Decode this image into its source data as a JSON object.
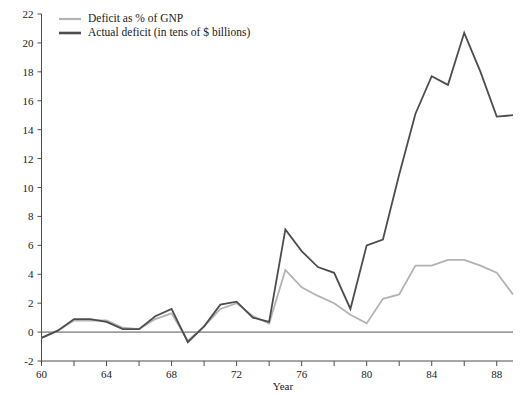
{
  "chart_data": {
    "type": "line",
    "title": "",
    "xlabel": "Year",
    "ylabel": "",
    "xlim": [
      60,
      89
    ],
    "ylim": [
      -2,
      22
    ],
    "grid": false,
    "legend_position": "top-left",
    "x": [
      60,
      61,
      62,
      63,
      64,
      65,
      66,
      67,
      68,
      69,
      70,
      71,
      72,
      73,
      74,
      75,
      76,
      77,
      78,
      79,
      80,
      81,
      82,
      83,
      84,
      85,
      86,
      87,
      88,
      89
    ],
    "x_tick_labels": [
      "60",
      "64",
      "68",
      "72",
      "76",
      "80",
      "84",
      "88"
    ],
    "x_tick_values": [
      60,
      64,
      68,
      72,
      76,
      80,
      84,
      88
    ],
    "x_minor_tick_values": [
      62,
      66,
      70,
      74,
      78,
      82,
      86
    ],
    "y_tick_labels": [
      "-2",
      "0",
      "2",
      "4",
      "6",
      "8",
      "10",
      "12",
      "14",
      "16",
      "18",
      "20",
      "22"
    ],
    "y_tick_values": [
      -2,
      0,
      2,
      4,
      6,
      8,
      10,
      12,
      14,
      16,
      18,
      20,
      22
    ],
    "series": [
      {
        "name": "Deficit as % of GNP",
        "color": "#b3b3b3",
        "line_width": 1.8,
        "values": [
          -0.4,
          0.1,
          0.8,
          0.8,
          0.8,
          0.3,
          0.2,
          0.9,
          1.3,
          -0.6,
          0.4,
          1.6,
          2.0,
          1.1,
          0.6,
          4.3,
          3.1,
          2.5,
          2.0,
          1.2,
          0.6,
          2.3,
          2.6,
          4.6,
          4.6,
          5.0,
          5.0,
          4.6,
          4.1,
          2.6
        ]
      },
      {
        "name": "Actual deficit (in tens of $ billions)",
        "color": "#4d4d4d",
        "line_width": 1.8,
        "values": [
          -0.4,
          0.1,
          0.9,
          0.9,
          0.7,
          0.2,
          0.2,
          1.1,
          1.6,
          -0.7,
          0.4,
          1.9,
          2.1,
          1.0,
          0.7,
          7.1,
          5.6,
          4.5,
          4.1,
          1.6,
          6.0,
          6.4,
          10.9,
          15.1,
          17.7,
          17.1,
          20.7,
          18.0,
          14.9,
          15.0
        ]
      }
    ],
    "legend": [
      {
        "label": "Deficit as % of GNP",
        "color": "#b3b3b3",
        "swatch": "legend-line-light"
      },
      {
        "label": "Actual deficit (in tens of $ billions)",
        "color": "#4d4d4d",
        "swatch": "legend-line-dark"
      }
    ],
    "zero_reference_line": 0
  }
}
